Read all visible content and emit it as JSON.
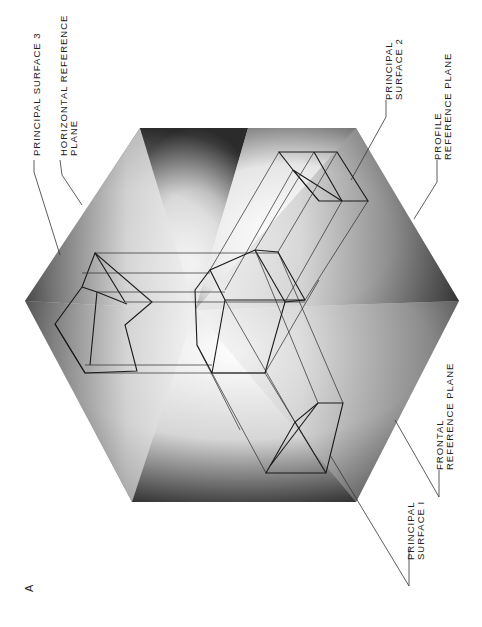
{
  "figure": {
    "letter": "A",
    "orientation": "rotated 90deg counter-clockwise"
  },
  "labels": {
    "principal_surface_3": "PRINCIPAL SURFACE 3",
    "horizontal_reference_plane_line1": "HORIZONTAL REFERENCE",
    "horizontal_reference_plane_line2": "PLANE",
    "principal_surface_2_line1": "PRINCIPAL",
    "principal_surface_2_line2": "SURFACE 2",
    "profile_reference_plane_line1": "PROFILE",
    "profile_reference_plane_line2": "REFERENCE PLANE",
    "frontal_reference_plane_line1": "FRONTAL",
    "frontal_reference_plane_line2": "REFERENCE PLANE",
    "principal_surface_1_line1": "PRINCIPAL",
    "principal_surface_1_line2": "SURFACE I"
  },
  "colors": {
    "plane_dark": "#2b2b2b",
    "plane_light": "#ffffff",
    "line": "#1a1a1a",
    "background": "#ffffff"
  },
  "hexagon_vertices": [
    [
      140,
      128
    ],
    [
      356,
      128
    ],
    [
      459,
      301
    ],
    [
      356,
      502
    ],
    [
      132,
      502
    ],
    [
      25,
      301
    ]
  ]
}
